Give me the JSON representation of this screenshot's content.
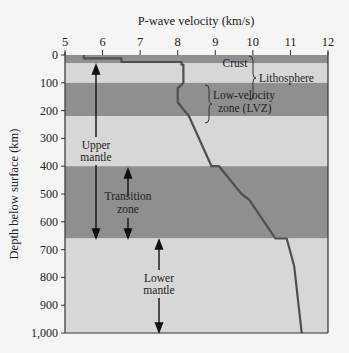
{
  "chart_data": {
    "type": "line",
    "title": "",
    "xlabel": "P-wave velocity (km/s)",
    "ylabel": "Depth below surface (km)",
    "xlim": [
      5,
      12
    ],
    "ylim": [
      0,
      1000
    ],
    "y_inverted": true,
    "x_ticks": [
      "5",
      "6",
      "7",
      "8",
      "9",
      "10",
      "11",
      "12"
    ],
    "y_ticks": [
      "0",
      "100",
      "200",
      "300",
      "400",
      "500",
      "600",
      "700",
      "800",
      "900",
      "1,000"
    ],
    "grid": false,
    "series": [
      {
        "name": "P-wave velocity profile",
        "points": [
          [
            5.5,
            0
          ],
          [
            5.5,
            12
          ],
          [
            6.5,
            12
          ],
          [
            6.5,
            25
          ],
          [
            8.1,
            25
          ],
          [
            8.1,
            35
          ],
          [
            8.15,
            35
          ],
          [
            8.15,
            100
          ],
          [
            8.0,
            120
          ],
          [
            8.0,
            170
          ],
          [
            8.3,
            220
          ],
          [
            8.9,
            400
          ],
          [
            9.1,
            400
          ],
          [
            9.7,
            500
          ],
          [
            9.9,
            520
          ],
          [
            10.6,
            660
          ],
          [
            10.9,
            660
          ],
          [
            11.1,
            760
          ],
          [
            11.3,
            1000
          ]
        ]
      }
    ],
    "bands": [
      {
        "label": "Crust",
        "from": 0,
        "to": 30,
        "shade": "dark"
      },
      {
        "label": "Lithosphere",
        "from": 30,
        "to": 100,
        "shade": "light"
      },
      {
        "label": "Low-velocity zone (LVZ)",
        "from": 100,
        "to": 220,
        "shade": "dark"
      },
      {
        "label": "",
        "from": 220,
        "to": 400,
        "shade": "light"
      },
      {
        "label": "Transition zone",
        "from": 400,
        "to": 660,
        "shade": "dark"
      },
      {
        "label": "Lower mantle",
        "from": 660,
        "to": 1000,
        "shade": "light"
      }
    ],
    "annotations": [
      {
        "text": "Crust",
        "x": 8.7,
        "y": 10
      },
      {
        "text": "Lithosphere",
        "x": 10.1,
        "y": 50,
        "brace": [
          0,
          100
        ]
      },
      {
        "text": "Low-velocity zone (LVZ)",
        "x": 9.3,
        "y": 150,
        "brace": [
          100,
          220
        ]
      },
      {
        "text": "Upper mantle",
        "x": 5.9,
        "y": 330,
        "arrow": [
          30,
          660
        ]
      },
      {
        "text": "Transition zone",
        "x": 6.6,
        "y": 530,
        "arrow": [
          400,
          660
        ]
      },
      {
        "text": "Lower mantle",
        "x": 7.3,
        "y": 870,
        "arrow": [
          660,
          1000
        ]
      }
    ]
  },
  "colors": {
    "dark_band": "#8f8f8f",
    "light_band": "#d7d7d5",
    "line": "#4f4f4f",
    "axis": "#333333"
  },
  "labels": {
    "xlabel": "P-wave velocity (km/s)",
    "ylabel": "Depth below surface (km)",
    "crust": "Crust",
    "lithosphere": "Lithosphere",
    "lvz_line1": "Low-velocity",
    "lvz_line2": "zone (LVZ)",
    "upper_line1": "Upper",
    "upper_line2": "mantle",
    "transition_line1": "Transition",
    "transition_line2": "zone",
    "lower_line1": "Lower",
    "lower_line2": "mantle"
  }
}
